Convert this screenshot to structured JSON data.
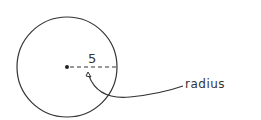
{
  "diagram": {
    "circle": {
      "cx": 67,
      "cy": 67,
      "r": 50
    },
    "radius_value": "5",
    "annotation_label": "radius",
    "stroke_color": "#333333"
  }
}
